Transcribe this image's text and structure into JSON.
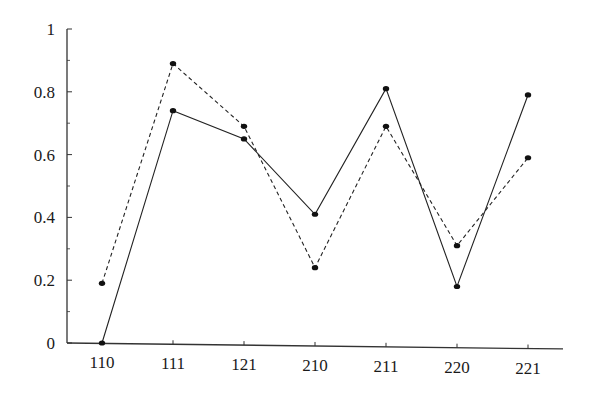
{
  "chart_data": {
    "type": "line",
    "title": "",
    "xlabel": "",
    "ylabel": "",
    "categories": [
      "110",
      "111",
      "121",
      "210",
      "211",
      "220",
      "221"
    ],
    "series": [
      {
        "name": "solid",
        "line_style": "solid",
        "values": [
          0.0,
          0.74,
          0.65,
          0.41,
          0.81,
          0.18,
          0.79
        ]
      },
      {
        "name": "dashed",
        "line_style": "dashed",
        "values": [
          0.19,
          0.89,
          0.69,
          0.24,
          0.69,
          0.31,
          0.59
        ]
      }
    ],
    "ylim": [
      0,
      1
    ],
    "yticks": [
      "0",
      "0.2",
      "0.4",
      "0.6",
      "0.8",
      "1"
    ],
    "grid": false,
    "legend": "none",
    "colors": {
      "line": "#222222",
      "marker": "#111111",
      "axis": "#333333"
    }
  }
}
